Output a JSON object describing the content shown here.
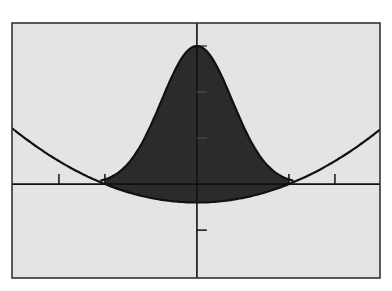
{
  "chart_data": {
    "type": "area",
    "title": "",
    "xlabel": "",
    "ylabel": "",
    "xlim": [
      -4.02,
      3.98
    ],
    "ylim": [
      -2.04,
      3.5
    ],
    "grid": false,
    "legend": null,
    "x_ticks": [
      -3,
      -2,
      2,
      3
    ],
    "y_ticks": [
      -1,
      1,
      2,
      3
    ],
    "tick_labels": false,
    "series": [
      {
        "name": "bell curve",
        "formula": "y = 3 e^(-0.85 x^2)",
        "x": [
          -2.5,
          -2.25,
          -2,
          -1.75,
          -1.5,
          -1.25,
          -1,
          -0.75,
          -0.5,
          -0.25,
          0,
          0.25,
          0.5,
          0.75,
          1,
          1.25,
          1.5,
          1.75,
          2,
          2.25,
          2.5
        ],
        "y": [
          0.015,
          0.04,
          0.1,
          0.22,
          0.45,
          0.8,
          1.28,
          1.86,
          2.43,
          2.85,
          3,
          2.85,
          2.43,
          1.86,
          1.28,
          0.8,
          0.45,
          0.22,
          0.1,
          0.04,
          0.015
        ]
      },
      {
        "name": "parabola",
        "formula": "y = 0.1 x^2 - 0.4",
        "x": [
          -4.02,
          -3.5,
          -3,
          -2.5,
          -2,
          -1.5,
          -1,
          -0.5,
          0,
          0.5,
          1,
          1.5,
          2,
          2.5,
          3,
          3.5,
          3.98
        ],
        "y": [
          1.216,
          0.825,
          0.5,
          0.225,
          0,
          -0.175,
          -0.3,
          -0.375,
          -0.4,
          -0.375,
          -0.3,
          -0.175,
          0,
          0.225,
          0.5,
          0.825,
          1.184
        ]
      }
    ],
    "shaded_region": {
      "between": [
        "bell curve",
        "parabola"
      ],
      "x_range": [
        -2,
        2
      ],
      "color": "#2b2b2b"
    },
    "intersections": [
      [
        -2,
        0
      ],
      [
        2,
        0
      ]
    ]
  },
  "style": {
    "background": "#e4e4e4",
    "frame_color": "#333333",
    "curve_color": "#111111",
    "fill_color": "#2b2b2b"
  }
}
